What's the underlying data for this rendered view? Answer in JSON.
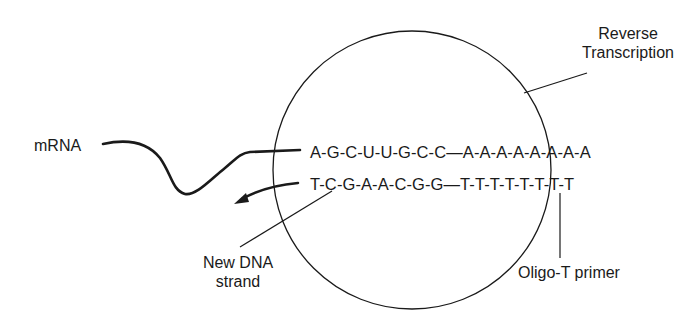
{
  "diagram": {
    "type": "reverse-transcription-schematic",
    "labels": {
      "mrna": "mRNA",
      "reverse_transcription_line1": "Reverse",
      "reverse_transcription_line2": "Transcription",
      "new_dna_line1": "New DNA",
      "new_dna_line2": "strand",
      "oligo_t_primer": "Oligo-T primer"
    },
    "sequences": {
      "mrna_strand": "A-G-C-U-U-G-C-C—A-A-A-A-A-A-A-A",
      "dna_strand": "T-C-G-A-A-C-G-G—T-T-T-T-T-T-T-T"
    },
    "colors": {
      "ink": "#1a1a1a",
      "background": "#ffffff"
    }
  }
}
